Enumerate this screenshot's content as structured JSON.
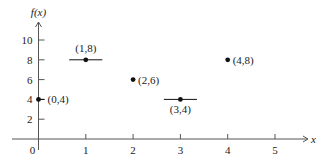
{
  "chart_data": {
    "type": "scatter",
    "title": "",
    "xlabel": "x",
    "ylabel": "f(x)",
    "xlim": [
      0,
      5.6
    ],
    "ylim": [
      0,
      11.2
    ],
    "grid": false,
    "legend": null,
    "x_ticks": [
      0,
      1,
      2,
      3,
      4,
      5
    ],
    "x_tick_labels": [
      "0",
      "1",
      "2",
      "3",
      "4",
      "5"
    ],
    "y_ticks": [
      2,
      4,
      6,
      8,
      10
    ],
    "y_tick_labels": [
      "2",
      "4",
      "6",
      "8",
      "10"
    ],
    "points": [
      {
        "x": 0,
        "y": 4,
        "label": "(0,4)",
        "label_pos": "right",
        "segment": false
      },
      {
        "x": 1,
        "y": 8,
        "label": "(1,8)",
        "label_pos": "above",
        "segment": true,
        "segment_x": [
          0.65,
          1.35
        ]
      },
      {
        "x": 2,
        "y": 6,
        "label": "(2,6)",
        "label_pos": "right",
        "segment": false
      },
      {
        "x": 3,
        "y": 4,
        "label": "(3,4)",
        "label_pos": "below",
        "segment": true,
        "segment_x": [
          2.65,
          3.35
        ]
      },
      {
        "x": 4,
        "y": 8,
        "label": "(4,8)",
        "label_pos": "right",
        "segment": false
      }
    ],
    "annotations": [
      "(0,4)",
      "(1,8)",
      "(2,6)",
      "(3,4)",
      "(4,8)"
    ],
    "colors": {
      "axis": "#555555",
      "point": "#111111",
      "text": "#222222"
    }
  }
}
